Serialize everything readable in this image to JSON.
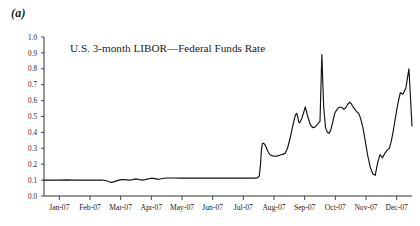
{
  "figure": {
    "panel_label": "(a)",
    "background_color": "#ffffff",
    "line_color": "#111111",
    "axis_color": "#333333"
  },
  "chart_data": {
    "type": "line",
    "title": "U.S. 3-month LIBOR—Federal Funds Rate",
    "xlabel": "",
    "ylabel": "",
    "ylim": [
      0.0,
      1.0
    ],
    "ytick_labels": [
      "0.0",
      "0.1",
      "0.2",
      "0.3",
      "0.4",
      "0.5",
      "0.6",
      "0.7",
      "0.8",
      "0.9",
      "1.0"
    ],
    "ytick_values": [
      0.0,
      0.1,
      0.2,
      0.3,
      0.4,
      0.5,
      0.6,
      0.7,
      0.8,
      0.9,
      1.0
    ],
    "categories": [
      "Jan-07",
      "Feb-07",
      "Mar-07",
      "Apr-07",
      "May-07",
      "Jun-07",
      "Jul-07",
      "Aug-07",
      "Sep-07",
      "Oct-07",
      "Nov-07",
      "Dec-07"
    ],
    "xtick_values": [
      0,
      1,
      2,
      3,
      4,
      5,
      6,
      7,
      8,
      9,
      10,
      11
    ],
    "grid": false,
    "legend": false,
    "series": [
      {
        "name": "U.S. 3-month LIBOR—Federal Funds Rate",
        "x": [
          0.0,
          0.18,
          0.36,
          0.55,
          0.74,
          0.95,
          1.14,
          1.33,
          1.52,
          1.72,
          1.88,
          1.96,
          2.04,
          2.12,
          2.2,
          2.28,
          2.36,
          2.44,
          2.52,
          2.6,
          2.7,
          2.8,
          2.9,
          3.0,
          3.1,
          3.2,
          3.3,
          3.4,
          3.5,
          3.62,
          3.74,
          3.86,
          4.0,
          4.2,
          4.45,
          4.7,
          5.0,
          5.3,
          5.6,
          5.9,
          6.2,
          6.5,
          6.7,
          6.85,
          6.95,
          7.02,
          7.06,
          7.09,
          7.12,
          7.16,
          7.22,
          7.3,
          7.38,
          7.46,
          7.54,
          7.62,
          7.7,
          7.78,
          7.86,
          7.94,
          8.02,
          8.1,
          8.16,
          8.2,
          8.24,
          8.27,
          8.3,
          8.33,
          8.36,
          8.4,
          8.46,
          8.52,
          8.6,
          8.68,
          8.76,
          8.84,
          8.92,
          9.0,
          9.06,
          9.12,
          9.18,
          9.24,
          9.3,
          9.36,
          9.42,
          9.48,
          9.54,
          9.6,
          9.66,
          9.72,
          9.78,
          9.84,
          9.9,
          9.96,
          10.02,
          10.08,
          10.14,
          10.2,
          10.26,
          10.32,
          10.4,
          10.48,
          10.56,
          10.64,
          10.72,
          10.8,
          10.88,
          10.96,
          11.04,
          11.12,
          11.2,
          11.26,
          11.32,
          11.38,
          11.44,
          11.5,
          11.56,
          11.62,
          11.7,
          11.8,
          11.9,
          12.0
        ],
        "y": [
          0.1,
          0.1,
          0.1,
          0.1,
          0.101,
          0.1,
          0.1,
          0.1,
          0.1,
          0.1,
          0.1,
          0.099,
          0.096,
          0.09,
          0.086,
          0.089,
          0.095,
          0.1,
          0.103,
          0.103,
          0.101,
          0.1,
          0.103,
          0.108,
          0.104,
          0.1,
          0.103,
          0.108,
          0.112,
          0.109,
          0.105,
          0.11,
          0.113,
          0.113,
          0.112,
          0.112,
          0.112,
          0.112,
          0.112,
          0.112,
          0.112,
          0.112,
          0.112,
          0.112,
          0.113,
          0.125,
          0.2,
          0.29,
          0.33,
          0.332,
          0.318,
          0.28,
          0.258,
          0.252,
          0.25,
          0.252,
          0.258,
          0.262,
          0.268,
          0.3,
          0.36,
          0.43,
          0.48,
          0.51,
          0.52,
          0.5,
          0.47,
          0.46,
          0.468,
          0.485,
          0.52,
          0.56,
          0.5,
          0.45,
          0.43,
          0.435,
          0.45,
          0.47,
          0.89,
          0.56,
          0.43,
          0.4,
          0.395,
          0.42,
          0.47,
          0.52,
          0.54,
          0.555,
          0.56,
          0.555,
          0.545,
          0.555,
          0.575,
          0.59,
          0.58,
          0.56,
          0.545,
          0.53,
          0.52,
          0.49,
          0.43,
          0.34,
          0.25,
          0.18,
          0.14,
          0.13,
          0.21,
          0.26,
          0.24,
          0.27,
          0.29,
          0.3,
          0.34,
          0.4,
          0.47,
          0.54,
          0.6,
          0.65,
          0.64,
          0.68,
          0.8,
          0.44
        ]
      }
    ],
    "annotations": [
      {
        "label": "August spike peak",
        "x": 9.06,
        "y": 0.89
      },
      {
        "label": "late-October trough",
        "x": 10.8,
        "y": 0.13
      },
      {
        "label": "December peak",
        "x": 11.9,
        "y": 0.8
      },
      {
        "label": "series end",
        "x": 12.0,
        "y": 0.44
      }
    ]
  }
}
